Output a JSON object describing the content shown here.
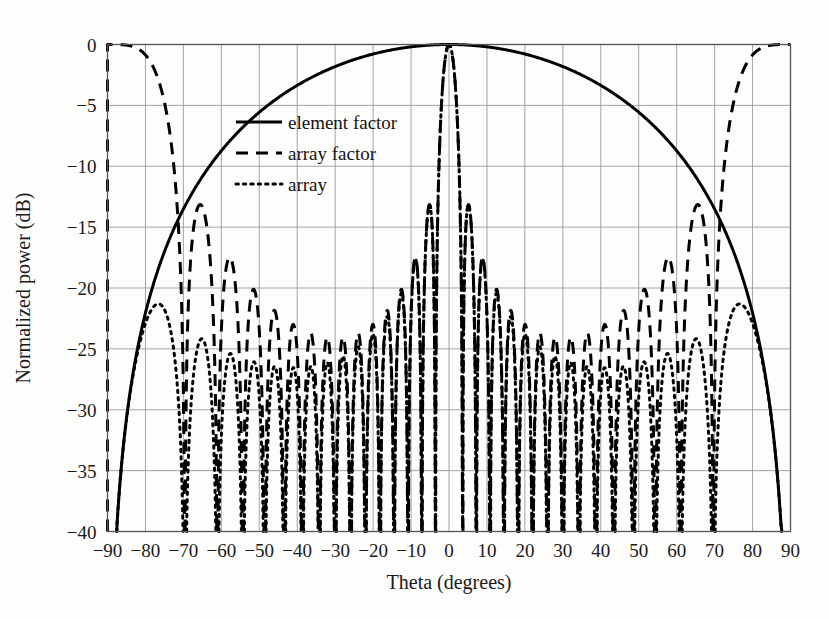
{
  "figure": {
    "background": "#fdfdfc",
    "width": 829,
    "height": 619
  },
  "axes": {
    "x_label": "Theta (degrees)",
    "y_label": "Normalized power (dB)",
    "x_ticks": [
      "-90",
      "-80",
      "-70",
      "-60",
      "-50",
      "-40",
      "-30",
      "-20",
      "-10",
      "0",
      "10",
      "20",
      "30",
      "40",
      "50",
      "60",
      "70",
      "80",
      "90"
    ],
    "y_ticks": [
      "0",
      "-5",
      "-10",
      "-15",
      "-20",
      "-25",
      "-30",
      "-35",
      "-40"
    ]
  },
  "legend": {
    "items": [
      {
        "label": "element factor",
        "style": "solid"
      },
      {
        "label": "array factor",
        "style": "dashed"
      },
      {
        "label": "array",
        "style": "dotted"
      }
    ]
  },
  "chart_data": {
    "type": "line",
    "title": "",
    "xlabel": "Theta (degrees)",
    "ylabel": "Normalized power (dB)",
    "xlim": [
      -90,
      90
    ],
    "ylim": [
      -40,
      0
    ],
    "xticks": [
      -90,
      -80,
      -70,
      -60,
      -50,
      -40,
      -30,
      -20,
      -10,
      0,
      10,
      20,
      30,
      40,
      50,
      60,
      70,
      80,
      90
    ],
    "yticks": [
      0,
      -5,
      -10,
      -15,
      -20,
      -25,
      -30,
      -35,
      -40
    ],
    "grid": true,
    "legend_position": "upper-left-inside",
    "line_color": "#000000",
    "series": [
      {
        "name": "element factor",
        "style": "solid",
        "model": "cos_power",
        "formula_note": "20*log10(cos(theta)^1.45); peak 0 dB at theta = 0, about -35 dB at theta = +/-89",
        "exponent": 1.45,
        "peak_db": 0,
        "endpoint_db": -35
      },
      {
        "name": "array factor",
        "style": "dashed",
        "model": "uniform_linear_array",
        "formula_note": "20*log10(|sin(N*psi/2)/(N*sin(psi/2))|), psi = 2*pi*(d/lambda)*sin(theta)",
        "n_elements": 16,
        "spacing_over_lambda": 1.0,
        "peak_db": 0,
        "grating_lobes_deg": [
          -90,
          90
        ],
        "first_sidelobe_db": -13.2
      },
      {
        "name": "array",
        "style": "dotted",
        "model": "product",
        "formula_note": "element factor (dB) + array factor (dB)",
        "peak_db": 0,
        "grating_lobe_level_db": -12.5
      }
    ]
  }
}
